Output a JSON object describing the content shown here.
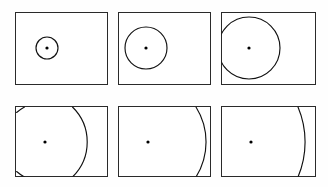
{
  "figure": {
    "name": "wavefront-curvature-series",
    "background_color": "#fefefe",
    "frame_color": "#2a2a2a",
    "curve_color": "#111111",
    "source_dot_color": "#000000",
    "panel_count": 6,
    "rows": 2,
    "columns": 3
  },
  "panels": [
    {
      "id": "panel-1",
      "row": 1,
      "column": 1,
      "frame": {
        "x": 15,
        "y": 12,
        "width": 93,
        "height": 73
      },
      "source": {
        "cx": 47,
        "cy": 48,
        "r": 1.6
      },
      "wavefront": {
        "kind": "circle",
        "cx": 47,
        "cy": 48,
        "radius": 11,
        "clipped": false
      }
    },
    {
      "id": "panel-2",
      "row": 1,
      "column": 2,
      "frame": {
        "x": 118,
        "y": 12,
        "width": 93,
        "height": 73
      },
      "source": {
        "cx": 146,
        "cy": 48,
        "r": 1.6
      },
      "wavefront": {
        "kind": "circle",
        "cx": 146,
        "cy": 48,
        "radius": 21,
        "clipped": false
      }
    },
    {
      "id": "panel-3",
      "row": 1,
      "column": 3,
      "frame": {
        "x": 221,
        "y": 12,
        "width": 95,
        "height": 73
      },
      "source": {
        "cx": 249,
        "cy": 48,
        "r": 1.6
      },
      "wavefront": {
        "kind": "circle",
        "cx": 249,
        "cy": 48,
        "radius": 31,
        "clipped": true
      }
    },
    {
      "id": "panel-4",
      "row": 2,
      "column": 1,
      "frame": {
        "x": 15,
        "y": 106,
        "width": 93,
        "height": 71
      },
      "source": {
        "cx": 45,
        "cy": 142,
        "r": 1.6
      },
      "wavefront": {
        "kind": "circle",
        "cx": 45,
        "cy": 142,
        "radius": 49,
        "clipped": true
      }
    },
    {
      "id": "panel-5",
      "row": 2,
      "column": 2,
      "frame": {
        "x": 118,
        "y": 106,
        "width": 93,
        "height": 71
      },
      "source": {
        "cx": 148,
        "cy": 142,
        "r": 1.6
      },
      "wavefront": {
        "kind": "circle",
        "cx": 148,
        "cy": 142,
        "radius": 66,
        "clipped": true
      }
    },
    {
      "id": "panel-6",
      "row": 2,
      "column": 3,
      "frame": {
        "x": 221,
        "y": 106,
        "width": 95,
        "height": 71
      },
      "source": {
        "cx": 251,
        "cy": 142,
        "r": 1.6
      },
      "wavefront": {
        "kind": "circle",
        "cx": 251,
        "cy": 142,
        "radius": 90,
        "clipped": true
      }
    }
  ],
  "geometry": {
    "panel_1_circle_path": "M 58,48 A 11,11 0 1 1 36,48 A 11,11 0 1 1 58,48 Z",
    "panel_2_circle_path": "M 167,48 A 21,21 0 1 1 125,48 A 21,21 0 1 1 167,48 Z",
    "panel_3_circle_path": "M 280,48 A 31,31 0 1 1 218,48 A 31,31 0 1 1 280,48 Z",
    "panel_4_arc_main": "M 72.5,107 A 49,49 0 0 1 72.5,177",
    "panel_4_arc_corner_top": "M 16.6,112.5 A 49,49 0 0 1 24.5,107",
    "panel_4_arc_corner_bottom": "M 24.5,177 A 49,49 0 0 1 16.6,171.5",
    "panel_5_arc_main": "M 196,107 A 66,66 0 0 1 196,177",
    "panel_6_arc_main": "M 298,107 A 90,90 0 0 1 298,177"
  }
}
